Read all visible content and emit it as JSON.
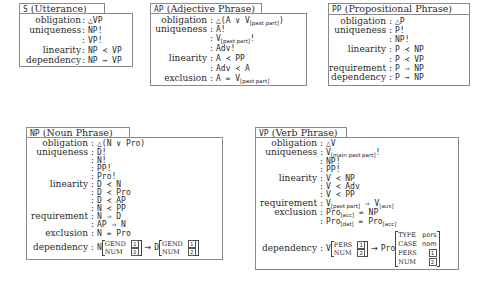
{
  "boxes": {
    "S": {
      "abbr": "S",
      "title": "(Utterance)",
      "rows": [
        {
          "label": "obligation",
          "value": "△VP"
        },
        {
          "label": "uniqueness",
          "value": "NP!"
        },
        {
          "label": "",
          "value": "VP!"
        },
        {
          "label": "linearity",
          "value": "NP ≺ VP"
        },
        {
          "label": "dependency",
          "value": "NP ⇝ VP"
        }
      ]
    },
    "AP": {
      "abbr": "AP",
      "title": "(Adjective Phrase)",
      "rows": [
        {
          "label": "obligation",
          "value": "△(A ∨ V",
          "sub": "[past part]",
          "after": ")"
        },
        {
          "label": "uniqueness",
          "value": "A!"
        },
        {
          "label": "",
          "value": "V",
          "sub": "[past part]",
          "after": "!"
        },
        {
          "label": "",
          "value": "Adv!"
        },
        {
          "label": "linearity",
          "value": "A ≺ PP"
        },
        {
          "label": "",
          "value": "Adv ≺ A"
        },
        {
          "label": "exclusion",
          "value": "A ⇎ V",
          "sub": "[past part]"
        }
      ]
    },
    "PP": {
      "abbr": "PP",
      "title": "(Propositional Phrase)",
      "rows": [
        {
          "label": "obligation",
          "value": "△P"
        },
        {
          "label": "uniqueness",
          "value": "P!"
        },
        {
          "label": "",
          "value": "NP!"
        },
        {
          "label": "linearity",
          "value": "P ≺ NP"
        },
        {
          "label": "",
          "value": "P ≺ VP"
        },
        {
          "label": "requirement",
          "value": "P ⇒ NP"
        },
        {
          "label": "dependency",
          "value": "P ⇝ NP"
        }
      ]
    },
    "NP": {
      "abbr": "NP",
      "title": "(Noun Phrase)",
      "rows": [
        {
          "label": "obligation",
          "value": "△(N ∨ Pro)"
        },
        {
          "label": "uniqueness",
          "value": "D!"
        },
        {
          "label": "",
          "value": "N!"
        },
        {
          "label": "",
          "value": "PP!"
        },
        {
          "label": "",
          "value": "Pro!"
        },
        {
          "label": "linearity",
          "value": "D ≺ N"
        },
        {
          "label": "",
          "value": "D ≺ Pro"
        },
        {
          "label": "",
          "value": "D ≺ AP"
        },
        {
          "label": "",
          "value": "N ≺ PP"
        },
        {
          "label": "requirement",
          "value": "N ⇒ D"
        },
        {
          "label": "",
          "value": "AP ⇒ N"
        },
        {
          "label": "exclusion",
          "value": "N ⇎ Pro"
        }
      ],
      "dependency": {
        "label": "dependency",
        "left": {
          "head": "N",
          "features": [
            {
              "attr": "GEND",
              "val": "1"
            },
            {
              "attr": "NUM",
              "val": "2"
            }
          ]
        },
        "arrow": "⇝",
        "right": {
          "head": "D",
          "features": [
            {
              "attr": "GEND",
              "val": "1"
            },
            {
              "attr": "NUM",
              "val": "2"
            }
          ]
        }
      }
    },
    "VP": {
      "abbr": "VP",
      "title": "(Verb Phrase)",
      "rows": [
        {
          "label": "obligation",
          "value": "△V"
        },
        {
          "label": "uniqueness",
          "value": "V",
          "sub": "[main past part]",
          "after": "!"
        },
        {
          "label": "",
          "value": "NP!"
        },
        {
          "label": "",
          "value": "PP!"
        },
        {
          "label": "linearity",
          "value": "V ≺ NP"
        },
        {
          "label": "",
          "value": "V ≺ Adv"
        },
        {
          "label": "",
          "value": "V ≺ PP"
        },
        {
          "label": "requirement",
          "value": "V",
          "sub": "[past part]",
          "after": " ⇒ V",
          "sub2": "[aux]"
        },
        {
          "label": "exclusion",
          "value": "Pro",
          "sub": "[acc]",
          "after": " ⇎ NP"
        },
        {
          "label": "",
          "value": "Pro",
          "sub": "[dat]",
          "after": " ⇎ Pro",
          "sub2": "[acc]"
        }
      ],
      "dependency": {
        "label": "dependency",
        "left": {
          "head": "V",
          "features": [
            {
              "attr": "PERS",
              "val": "1"
            },
            {
              "attr": "NUM",
              "val": "2"
            }
          ]
        },
        "arrow": "⇝",
        "right": {
          "head": "Pro",
          "features": [
            {
              "attr": "TYPE",
              "val": "pers"
            },
            {
              "attr": "CASE",
              "val": "nom"
            },
            {
              "attr": "PERS",
              "val": "1"
            },
            {
              "attr": "NUM",
              "val": "2"
            }
          ]
        }
      }
    }
  }
}
